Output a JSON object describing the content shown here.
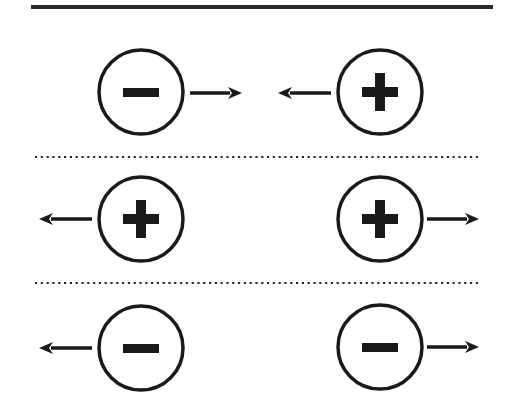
{
  "diagram": {
    "title": "Electric charge interactions: opposite charges attract, like charges repel",
    "width": 507,
    "height": 419,
    "colors": {
      "background": "#ffffff",
      "stroke": "#1a1a1a",
      "divider": "#2a2a2a"
    },
    "top_rule": {
      "x1": 31,
      "x2": 493,
      "y": 7,
      "thickness": 4,
      "style": "solid"
    },
    "separators": [
      {
        "x1": 35,
        "x2": 480,
        "y": 157,
        "style": "dotted"
      },
      {
        "x1": 35,
        "x2": 480,
        "y": 283,
        "style": "dotted"
      }
    ],
    "rows": [
      {
        "id": "attract-opposite",
        "interaction": "attraction",
        "charges": [
          {
            "sign": "negative",
            "symbol": "−",
            "cx": 141,
            "cy": 92,
            "r": 42,
            "arrow": {
              "direction": "right",
              "x_tail": 190,
              "x_tip": 242,
              "y": 93
            }
          },
          {
            "sign": "positive",
            "symbol": "+",
            "cx": 380,
            "cy": 92,
            "r": 42,
            "arrow": {
              "direction": "left",
              "x_tail": 331,
              "x_tip": 278,
              "y": 93
            }
          }
        ]
      },
      {
        "id": "repel-positive",
        "interaction": "repulsion",
        "charges": [
          {
            "sign": "positive",
            "symbol": "+",
            "cx": 141,
            "cy": 219,
            "r": 42,
            "arrow": {
              "direction": "left",
              "x_tail": 92,
              "x_tip": 39,
              "y": 219
            }
          },
          {
            "sign": "positive",
            "symbol": "+",
            "cx": 380,
            "cy": 219,
            "r": 42,
            "arrow": {
              "direction": "right",
              "x_tail": 427,
              "x_tip": 479,
              "y": 219
            }
          }
        ]
      },
      {
        "id": "repel-negative",
        "interaction": "repulsion",
        "charges": [
          {
            "sign": "negative",
            "symbol": "−",
            "cx": 141,
            "cy": 348,
            "r": 42,
            "arrow": {
              "direction": "left",
              "x_tail": 92,
              "x_tip": 39,
              "y": 348
            }
          },
          {
            "sign": "negative",
            "symbol": "−",
            "cx": 380,
            "cy": 347,
            "r": 42,
            "arrow": {
              "direction": "right",
              "x_tail": 427,
              "x_tip": 479,
              "y": 347
            }
          }
        ]
      }
    ]
  }
}
